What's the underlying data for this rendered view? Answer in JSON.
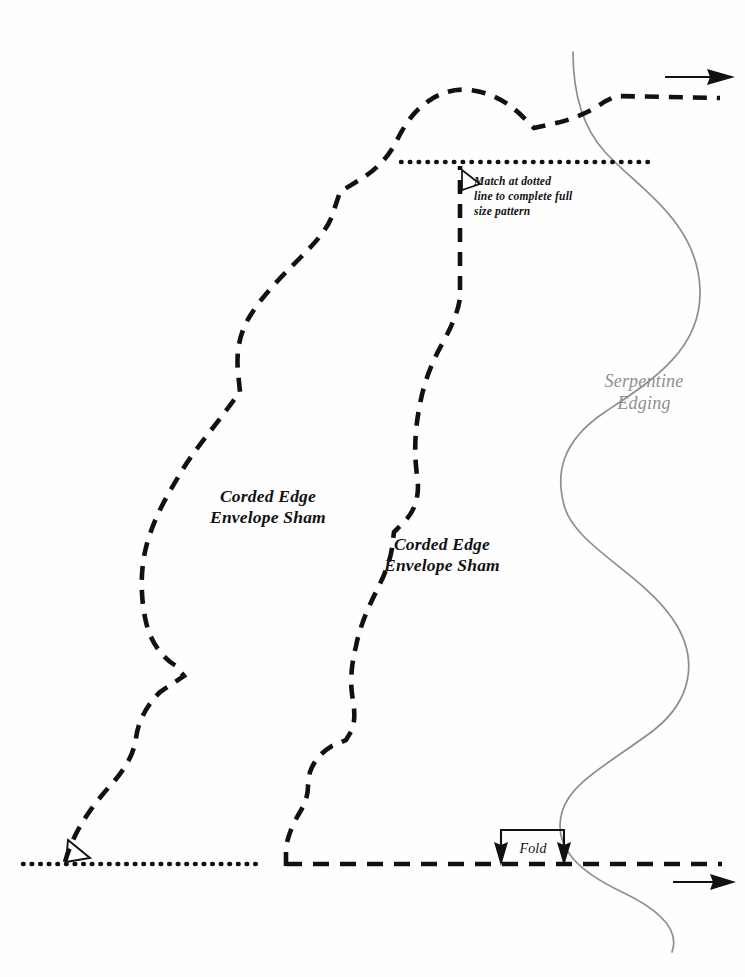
{
  "document": {
    "kind": "sewing-pattern-sheet",
    "background_color": "#fefefe",
    "width": 745,
    "height": 977
  },
  "labels": {
    "sham_left": "Corded Edge\nEnvelope Sham",
    "sham_right": "Corded Edge\nEnvelope Sham",
    "serpentine": "Serpentine\nEdging",
    "match_note": "Match at dotted\nline to complete full\nsize pattern",
    "fold": "Fold"
  },
  "colors": {
    "ink": "#111111",
    "serpentine": "#8e8e8e",
    "paper": "#fefefe"
  },
  "elements": {
    "cutting_line_left": {
      "name": "Corded Edge Envelope Sham cutting line (left)",
      "style": "dashed",
      "stroke_width": 4.6
    },
    "cutting_line_right": {
      "name": "Corded Edge Envelope Sham cutting line (right)",
      "style": "dashed",
      "stroke_width": 4.6
    },
    "serpentine_edging_curve": {
      "name": "Serpentine Edging wave",
      "style": "solid",
      "stroke_width": 1.6
    },
    "match_dotted_line_top": {
      "name": "top match dotted line",
      "style": "dotted",
      "x_start": 400,
      "x_end": 655,
      "y": 162
    },
    "match_dotted_line_bottom": {
      "name": "bottom match dotted line",
      "style": "dotted",
      "x_start": 22,
      "x_end": 258,
      "y": 864
    },
    "fold_line_bottom": {
      "name": "fold / grainline dashed line",
      "style": "dashed",
      "y": 864
    },
    "grain_arrow_top": {
      "name": "grainline arrow top right",
      "direction": "right"
    },
    "grain_arrow_bottom": {
      "name": "grainline arrow bottom right",
      "direction": "right"
    },
    "right_angle_mark_top": {
      "name": "right angle mark near top match point"
    },
    "right_angle_mark_bottom": {
      "name": "right angle mark near bottom left corner"
    },
    "fold_bracket": {
      "name": "fold bracket with two down arrows",
      "x_left": 500,
      "x_right": 565,
      "y_top": 830,
      "y_bottom": 864
    }
  }
}
